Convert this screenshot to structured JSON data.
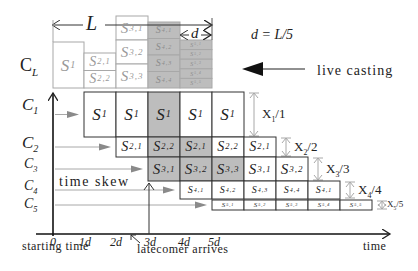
{
  "colors": {
    "line": "#333333",
    "light_line": "#a8a8a8",
    "gray_fill": "#bdbdbd",
    "white_fill": "#ffffff",
    "arrow_gray": "#8a8a8a",
    "text": "#222222",
    "light_text": "#9a9a9a"
  },
  "top": {
    "length_label": "L",
    "segment_label": "d",
    "formula": "d = L/5",
    "live_casting": "live casting",
    "channel_label": "C",
    "channel_sub": "L"
  },
  "top_columns": [
    {
      "x": 53,
      "top": 42,
      "cells": [
        {
          "s": "S",
          "sub": "1"
        }
      ],
      "gray": false
    },
    {
      "x": 84,
      "top": 53,
      "cells": [
        {
          "s": "S",
          "sub": "2,1"
        },
        {
          "s": "S",
          "sub": "2,2"
        }
      ],
      "gray": false
    },
    {
      "x": 116,
      "top": 16,
      "cells": [
        {
          "s": "S",
          "sub": "3,1"
        },
        {
          "s": "S",
          "sub": "3,2"
        },
        {
          "s": "S",
          "sub": "3,3"
        }
      ],
      "gray": false
    },
    {
      "x": 148,
      "top": 22,
      "cells": [
        {
          "s": "S",
          "sub": "4,1"
        },
        {
          "s": "S",
          "sub": "4,2"
        },
        {
          "s": "S",
          "sub": "4,3"
        },
        {
          "s": "S",
          "sub": "4,4"
        }
      ],
      "gray": true
    },
    {
      "x": 180,
      "top": 40,
      "cells": [
        {
          "s": "S",
          "sub": "5,1"
        },
        {
          "s": "S",
          "sub": "5,2"
        },
        {
          "s": "S",
          "sub": "5,3"
        },
        {
          "s": "S",
          "sub": "5,4"
        },
        {
          "s": "S",
          "sub": "5,5"
        }
      ],
      "gray": true
    }
  ],
  "channels": [
    {
      "name": "C",
      "sub": "1",
      "y": 92,
      "h": 45,
      "start": 84,
      "bandwidth": "X",
      "bw_sub": "1",
      "bw_div": "/1",
      "font": 17,
      "cells": [
        {
          "s": "S",
          "sub": "1",
          "gray": false
        },
        {
          "s": "S",
          "sub": "1",
          "gray": false
        },
        {
          "s": "S",
          "sub": "1",
          "gray": true
        },
        {
          "s": "S",
          "sub": "1",
          "gray": false
        },
        {
          "s": "S",
          "sub": "1",
          "gray": false
        }
      ]
    },
    {
      "name": "C",
      "sub": "2",
      "y": 137,
      "h": 20,
      "start": 116,
      "bandwidth": "X",
      "bw_sub": "2",
      "bw_div": "/2",
      "font": 14,
      "cells": [
        {
          "s": "S",
          "sub": "2,1",
          "gray": false
        },
        {
          "s": "S",
          "sub": "2,2",
          "gray": true
        },
        {
          "s": "S",
          "sub": "2,1",
          "gray": true
        },
        {
          "s": "S",
          "sub": "2,2",
          "gray": false
        },
        {
          "s": "S",
          "sub": "2,1",
          "gray": false
        }
      ]
    },
    {
      "name": "C",
      "sub": "3",
      "y": 157,
      "h": 24,
      "start": 148,
      "bandwidth": "X",
      "bw_sub": "3",
      "bw_div": "/3",
      "font": 15,
      "cells": [
        {
          "s": "S",
          "sub": "3,1",
          "gray": true
        },
        {
          "s": "S",
          "sub": "3,2",
          "gray": true
        },
        {
          "s": "S",
          "sub": "3,3",
          "gray": true
        },
        {
          "s": "S",
          "sub": "3,1",
          "gray": false
        },
        {
          "s": "S",
          "sub": "3,2",
          "gray": false
        }
      ]
    },
    {
      "name": "C",
      "sub": "4",
      "y": 181,
      "h": 18,
      "start": 180,
      "bandwidth": "X",
      "bw_sub": "4",
      "bw_div": "/4",
      "font": 10,
      "cells": [
        {
          "s": "S",
          "sub": "4,1",
          "gray": false
        },
        {
          "s": "S",
          "sub": "4,2",
          "gray": false
        },
        {
          "s": "S",
          "sub": "4,3",
          "gray": false
        },
        {
          "s": "S",
          "sub": "4,4",
          "gray": false
        },
        {
          "s": "S",
          "sub": "4,1",
          "gray": false
        }
      ]
    },
    {
      "name": "C",
      "sub": "5",
      "y": 200,
      "h": 10,
      "start": 212,
      "bandwidth": "X",
      "bw_sub": "5",
      "bw_div": "/5",
      "font": 7,
      "cells": [
        {
          "s": "S",
          "sub": "5,1",
          "gray": false
        },
        {
          "s": "S",
          "sub": "5,2",
          "gray": false
        },
        {
          "s": "S",
          "sub": "5,3",
          "gray": false
        },
        {
          "s": "S",
          "sub": "5,4",
          "gray": false
        },
        {
          "s": "S",
          "sub": "5,5",
          "gray": false
        }
      ]
    }
  ],
  "annotations": {
    "time_skew": "time skew",
    "starting_time": "starting time",
    "latecomer": "latecomer arrives",
    "time": "time"
  },
  "ticks": [
    {
      "label": "0",
      "x": 53
    },
    {
      "label": "1d",
      "x": 85
    },
    {
      "label": "2d",
      "x": 116
    },
    {
      "label": "3d",
      "x": 150
    },
    {
      "label": "4d",
      "x": 184
    },
    {
      "label": "5d",
      "x": 214
    }
  ]
}
